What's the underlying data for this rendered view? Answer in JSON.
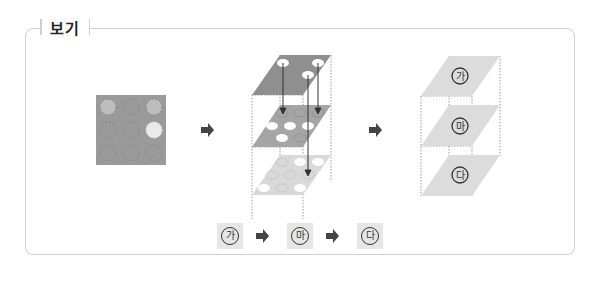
{
  "title": "보기",
  "stages": {
    "grid": {
      "rows": 3,
      "cols": 3,
      "bg": "#9a9a9a",
      "highlights": [
        [
          0,
          0,
          "#bdbdbd"
        ],
        [
          0,
          2,
          "#bdbdbd"
        ],
        [
          1,
          2,
          "#eaeaea"
        ]
      ]
    },
    "stack_layers": [
      "top",
      "middle",
      "bottom"
    ],
    "result_layers": [
      "㉮",
      "㉴",
      "㉰"
    ]
  },
  "layers": {
    "top": "가",
    "middle": "마",
    "bottom": "다"
  },
  "sequence": [
    "가",
    "마",
    "다"
  ],
  "colors": {
    "border": "#cfcfcf",
    "dark_plate": "#8f8f8f",
    "mid_plate": "#a5a5a5",
    "light_plate": "#d9d9d9",
    "arrow": "#444444"
  }
}
